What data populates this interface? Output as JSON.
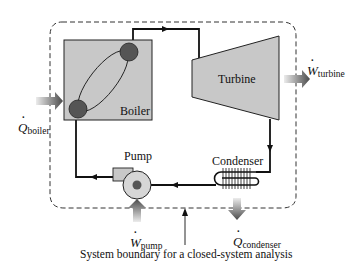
{
  "diagram": {
    "type": "vapor power cycle schematic",
    "components": {
      "boiler": {
        "label": "Boiler"
      },
      "turbine": {
        "label": "Turbine"
      },
      "condenser": {
        "label": "Condenser"
      },
      "pump": {
        "label": "Pump"
      }
    },
    "energy_flows": {
      "q_boiler": {
        "symbol": "Q",
        "subscript": "boiler",
        "direction": "in"
      },
      "w_turbine": {
        "symbol": "W",
        "subscript": "turbine",
        "direction": "out"
      },
      "w_pump": {
        "symbol": "W",
        "subscript": "pump",
        "direction": "in"
      },
      "q_condenser": {
        "symbol": "Q",
        "subscript": "condenser",
        "direction": "out"
      }
    },
    "caption": "System boundary for a closed-system analysis",
    "colors": {
      "component_fill": "#c8c8c8",
      "circle_fill": "#555555",
      "line": "#111111",
      "boundary": "#333333",
      "arrow_dark": "#555555",
      "arrow_light": "#d0d0d0"
    }
  }
}
